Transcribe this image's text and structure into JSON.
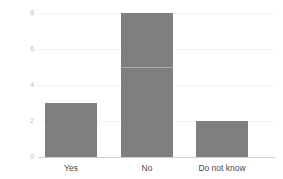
{
  "chart_data": {
    "type": "bar",
    "title": "",
    "subtitle": "",
    "xlabel": "",
    "ylabel": "",
    "categories": [
      "Yes",
      "No",
      "Do not know"
    ],
    "values": [
      3,
      8,
      2
    ],
    "series": [
      {
        "name": "Count",
        "values": [
          3,
          8,
          2
        ]
      }
    ],
    "ylim": [
      0,
      8
    ],
    "yticks": [
      0,
      2,
      4,
      6,
      8
    ],
    "ytick_labels": [
      "0",
      "2",
      "4",
      "6",
      "8"
    ],
    "grid": true,
    "grid_axis": "y",
    "legend": false,
    "legend_position": "none",
    "annotations": [],
    "colors": {
      "bar": "#7f7f7f",
      "gridline": "#f4f4f4",
      "axis": "#cfcfcf",
      "ytick_label": "#b9b9b9",
      "xtick_label": "#4a4a4a",
      "background": "#ffffff"
    }
  }
}
